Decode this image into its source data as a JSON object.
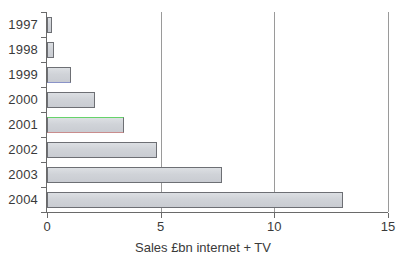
{
  "chart_data": {
    "type": "bar",
    "orientation": "horizontal",
    "title": "",
    "xlabel": "Sales £bn internet + TV",
    "ylabel": "",
    "categories": [
      "1997",
      "1998",
      "1999",
      "2000",
      "2001",
      "2002",
      "2003",
      "2004"
    ],
    "values": [
      0.2,
      0.3,
      1.05,
      2.1,
      3.4,
      4.85,
      7.7,
      13.0
    ],
    "xlim": [
      0,
      15
    ],
    "xticks": [
      "0",
      "5",
      "10",
      "15"
    ],
    "xtick_values": [
      0,
      5,
      10,
      15
    ],
    "gridlines": [
      5,
      10,
      15
    ],
    "grid": true,
    "legend": null,
    "bar_fill_color": "#d0d3d8",
    "bar_edge_color": "#6d6f74",
    "axis_color": "#6a6a6a",
    "background_color": "#ffffff",
    "text_color": "#3a3a3a"
  }
}
